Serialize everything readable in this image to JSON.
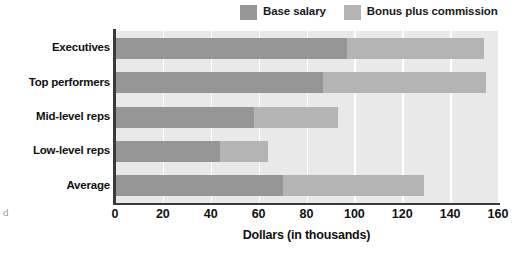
{
  "chart_data": {
    "type": "bar",
    "orientation": "horizontal",
    "stacked": true,
    "title": "",
    "xlabel": "Dollars (in thousands)",
    "ylabel": "",
    "xlim": [
      0,
      160
    ],
    "xticks": [
      0,
      20,
      40,
      60,
      80,
      100,
      120,
      140,
      160
    ],
    "xtick_labels": [
      "0",
      "20",
      "40",
      "60",
      "80",
      "100",
      "120",
      "140",
      "160"
    ],
    "categories": [
      "Executives",
      "Top performers",
      "Mid-level reps",
      "Low-level reps",
      "Average"
    ],
    "series": [
      {
        "name": "Base salary",
        "color": "#969696",
        "values": [
          97,
          87,
          58,
          44,
          70
        ]
      },
      {
        "name": "Bonus plus commission",
        "color": "#b4b4b4",
        "values": [
          57,
          68,
          35,
          20,
          59
        ]
      }
    ],
    "totals": [
      154,
      155,
      93,
      64,
      129
    ],
    "grid": {
      "vertical": true,
      "horizontal": false,
      "color": "#ffffff"
    },
    "legend": {
      "position": "top-right",
      "entries": [
        "Base salary",
        "Bonus plus commission"
      ]
    },
    "plot_background": "#e9e9e9",
    "axis_color": "#3a3a3a"
  },
  "legend": {
    "entries": [
      {
        "label": "Base salary",
        "swatch": "#969696",
        "icon": "legend-swatch-icon"
      },
      {
        "label": "Bonus plus commission",
        "swatch": "#b4b4b4",
        "icon": "legend-swatch-icon"
      }
    ]
  },
  "axes": {
    "x_title": "Dollars (in thousands)",
    "x_ticks": [
      "0",
      "20",
      "40",
      "60",
      "80",
      "100",
      "120",
      "140",
      "160"
    ],
    "y_categories": [
      "Executives",
      "Top performers",
      "Mid-level reps",
      "Low-level reps",
      "Average"
    ]
  },
  "artifact": {
    "margin_mark": "d"
  }
}
